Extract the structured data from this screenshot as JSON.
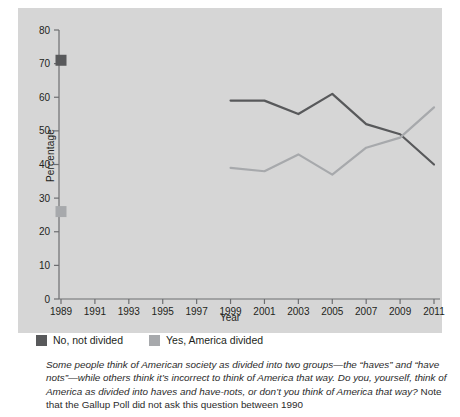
{
  "chart_data": {
    "type": "line",
    "title": "",
    "xlabel": "Year",
    "ylabel": "Percentage",
    "xlim": [
      1988,
      2012
    ],
    "ylim": [
      0,
      80
    ],
    "yticks": [
      0,
      10,
      20,
      30,
      40,
      50,
      60,
      70,
      80
    ],
    "xticks": [
      1989,
      1991,
      1993,
      1995,
      1997,
      1999,
      2001,
      2003,
      2005,
      2007,
      2009,
      2011
    ],
    "grid": false,
    "legend_position": "below-axis",
    "note": "No data collected between 1990 and 1998; 1989 shown as isolated markers.",
    "series": [
      {
        "name": "No, not divided",
        "color": "#58595b",
        "marker_points": [
          {
            "x": 1989,
            "y": 71
          }
        ],
        "x": [
          1999,
          2001,
          2003,
          2005,
          2007,
          2009,
          2011
        ],
        "values": [
          59,
          59,
          55,
          61,
          52,
          49,
          40
        ]
      },
      {
        "name": "Yes, America divided",
        "color": "#a7a9ac",
        "marker_points": [
          {
            "x": 1989,
            "y": 26
          }
        ],
        "x": [
          1999,
          2001,
          2003,
          2005,
          2007,
          2009,
          2011
        ],
        "values": [
          39,
          38,
          43,
          37,
          45,
          48,
          57
        ]
      }
    ]
  },
  "axes": {
    "ylabel": "Percentage",
    "xlabel": "Year",
    "ytick_labels": [
      "0",
      "10",
      "20",
      "30",
      "40",
      "50",
      "60",
      "70",
      "80"
    ],
    "xtick_labels": [
      "1989",
      "1991",
      "1993",
      "1995",
      "1997",
      "1999",
      "2001",
      "2003",
      "2005",
      "2007",
      "2009",
      "2011"
    ]
  },
  "legend": {
    "items": [
      {
        "label": "No, not divided",
        "color": "#58595b"
      },
      {
        "label": "Yes, America divided",
        "color": "#a7a9ac"
      }
    ]
  },
  "caption": {
    "question": "Some people think of American society as divided into two groups—the “haves” and “have nots”—while others think it’s incorrect to think of America that way. Do you, yourself, think of America as divided into haves and have-nots, or don’t you think of America that way?",
    "note": " Note that the Gallup Poll did not ask this question between 1990"
  }
}
